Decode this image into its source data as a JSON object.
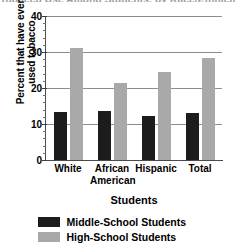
{
  "chart_data": {
    "type": "bar",
    "title": "Tobacco Use Among Students, by Race/Ethnicity",
    "title_clipped": true,
    "xlabel": "Students",
    "ylabel_lines": [
      "Percent that have ever",
      "used tobacco"
    ],
    "ylabel": "Percent that have ever used tobacco",
    "categories": [
      "White",
      "African American",
      "Hispanic",
      "Total"
    ],
    "category_lines": [
      [
        "White"
      ],
      [
        "African",
        "American"
      ],
      [
        "Hispanic"
      ],
      [
        "Total"
      ]
    ],
    "series": [
      {
        "name": "Middle-School Students",
        "color": "#1c1c1c",
        "values": [
          13.2,
          13.6,
          12.3,
          13.1
        ]
      },
      {
        "name": "High-School Students",
        "color": "#a9a9a9",
        "values": [
          31.2,
          21.5,
          24.5,
          28.2
        ]
      }
    ],
    "ylim": [
      0,
      40
    ],
    "yticks": [
      0,
      10,
      20,
      30,
      40
    ],
    "ytick_labels": [
      "0",
      "10",
      "20",
      "30",
      "40"
    ],
    "y_minor_step": 2,
    "grid": true,
    "grid_axis": "y",
    "legend_position": "bottom"
  },
  "legend": {
    "entries": [
      {
        "label": "Middle-School Students",
        "color": "#1c1c1c"
      },
      {
        "label": "High-School Students",
        "color": "#a9a9a9"
      }
    ]
  },
  "colors": {
    "middle_school": "#1c1c1c",
    "high_school": "#a9a9a9",
    "gridline": "#8d8d8d",
    "axis": "#4a4a4a",
    "background": "#ffffff"
  }
}
